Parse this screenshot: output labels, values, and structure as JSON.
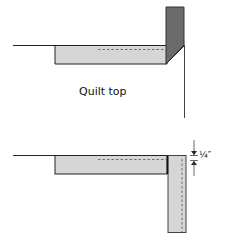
{
  "figure": {
    "top_panel": {
      "label": "Quilt top"
    },
    "bottom_panel": {
      "measurement_label": "¼″"
    }
  },
  "colors": {
    "binding_light": "#d6d6d6",
    "binding_dark": "#6b6b6b",
    "line": "#222222",
    "stitch": "#555555"
  }
}
